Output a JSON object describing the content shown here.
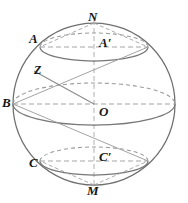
{
  "figure": {
    "type": "geometric-diagram",
    "canvas": {
      "width": 188,
      "height": 203,
      "background": "#ffffff"
    },
    "colors": {
      "outline": "#6f6f6f",
      "solid_curve": "#7a7a7a",
      "dashed_curve": "#9a9a9a",
      "axis": "#a8a8a8",
      "chord": "#8a8a8a",
      "label": "#151515"
    },
    "sphere": {
      "center_x": 94,
      "center_y": 104,
      "radius": 81
    },
    "points": [
      {
        "id": "N",
        "label": "N",
        "x": 94,
        "y": 23,
        "role": "north-pole",
        "label_x": 88,
        "label_y": 12
      },
      {
        "id": "M",
        "label": "M",
        "x": 94,
        "y": 185,
        "role": "south-pole",
        "label_x": 88,
        "label_y": 186
      },
      {
        "id": "B",
        "label": "B",
        "x": 13,
        "y": 104,
        "role": "equator-left",
        "label_x": 2,
        "label_y": 97
      },
      {
        "id": "O",
        "label": "O",
        "x": 94,
        "y": 104,
        "role": "center",
        "label_x": 100,
        "label_y": 105
      },
      {
        "id": "A",
        "label": "A",
        "x": 40,
        "y": 47,
        "role": "upper-circle-left",
        "label_x": 29,
        "label_y": 34
      },
      {
        "id": "Ap",
        "label": "A′",
        "x": 94,
        "y": 47,
        "role": "upper-circle-center",
        "label_x": 100,
        "label_y": 38
      },
      {
        "id": "C",
        "label": "C",
        "x": 40,
        "y": 161,
        "role": "lower-circle-left",
        "label_x": 29,
        "label_y": 157
      },
      {
        "id": "Cp",
        "label": "C′",
        "x": 94,
        "y": 161,
        "role": "lower-circle-center",
        "label_x": 100,
        "label_y": 152
      },
      {
        "id": "Z",
        "label": "Z",
        "x": 34,
        "y": 71,
        "role": "surface-point",
        "label_x": 36,
        "label_y": 66
      }
    ],
    "circles": [
      {
        "id": "upper-latitude",
        "center_x": 94,
        "center_y": 47,
        "rx": 54,
        "ry": 14,
        "front": "solid",
        "back": "dashed"
      },
      {
        "id": "equator",
        "center_x": 94,
        "center_y": 104,
        "rx": 81,
        "ry": 21,
        "front": "solid",
        "back": "dashed"
      },
      {
        "id": "lower-latitude",
        "center_x": 94,
        "center_y": 161,
        "rx": 54,
        "ry": 14,
        "front": "solid",
        "back": "dashed"
      }
    ],
    "segments": [
      {
        "id": "polar-axis",
        "from": "N",
        "to": "M",
        "style": "dashed"
      },
      {
        "id": "equator-diameter",
        "from": "B",
        "to": "equator-right",
        "style": "dashed"
      },
      {
        "id": "upper-diameter",
        "from": "A",
        "to": "upper-right",
        "style": "dashed"
      },
      {
        "id": "lower-diameter",
        "from": "C",
        "to": "lower-right",
        "style": "dashed"
      },
      {
        "id": "ZO-chord",
        "from": "Z",
        "to": "O",
        "style": "solid"
      },
      {
        "id": "N-to-upper-left",
        "from": "N",
        "to": "A",
        "style": "dashed"
      },
      {
        "id": "N-to-upper-right",
        "from": "N",
        "to": "upper-right",
        "style": "dashed"
      },
      {
        "id": "M-to-lower-left",
        "from": "M",
        "to": "C",
        "style": "dashed"
      },
      {
        "id": "M-to-lower-right",
        "from": "M",
        "to": "lower-right",
        "style": "dashed"
      },
      {
        "id": "B-to-upper-right",
        "from": "B",
        "to": "upper-right",
        "style": "solid"
      },
      {
        "id": "B-to-lower-right",
        "from": "B",
        "to": "lower-right",
        "style": "solid"
      }
    ]
  }
}
